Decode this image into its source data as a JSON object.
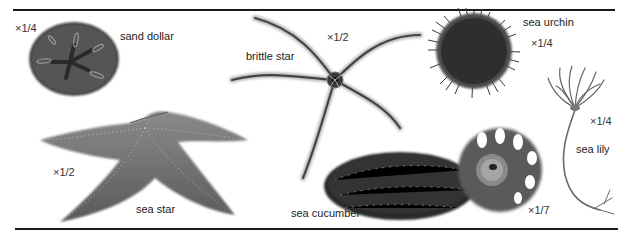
{
  "figure": {
    "specimens": [
      {
        "id": "sand-dollar",
        "name": "sand dollar",
        "scale": "×1/4"
      },
      {
        "id": "brittle-star",
        "name": "brittle star",
        "scale": "×1/2"
      },
      {
        "id": "sea-urchin",
        "name": "sea urchin",
        "scale": "×1/4"
      },
      {
        "id": "sea-lily",
        "name": "sea lily",
        "scale": "×1/4"
      },
      {
        "id": "sea-star",
        "name": "sea star",
        "scale": "×1/2"
      },
      {
        "id": "sea-cucumber",
        "name": "sea cucumber",
        "scale": "×1/7"
      }
    ]
  },
  "colors": {
    "rule": "#1a1a1a",
    "dark_body": "#3a3a3a",
    "mid_body": "#6b6b6b",
    "light_body": "#9a9a9a"
  }
}
